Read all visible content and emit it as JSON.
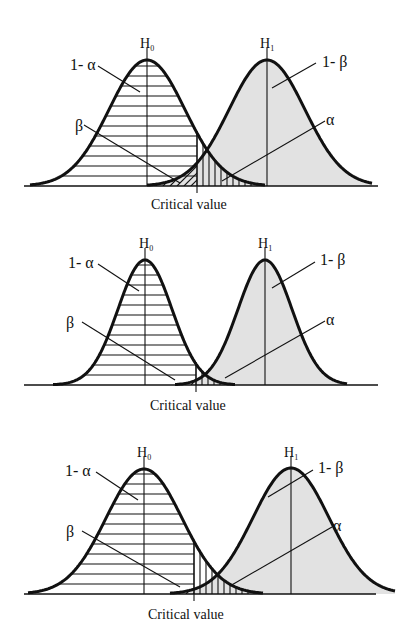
{
  "figure": {
    "colors": {
      "h1_fill": "#e2e2e2",
      "ink": "#111111",
      "background": "#ffffff"
    },
    "labels": {
      "h0": "H",
      "h0_sub": "0",
      "h1": "H",
      "h1_sub": "1",
      "one_minus_alpha": "1- α",
      "one_minus_beta": "1- β",
      "alpha": "α",
      "beta": "β",
      "critical_value": "Critical value"
    },
    "panels": [
      {
        "id": "panel-1",
        "baseline_y": 186,
        "axis_x": [
          24,
          378
        ],
        "h0": {
          "mean_x": 147,
          "peak_y": 60,
          "sigma": 38,
          "left_x": 30,
          "right_x": 265
        },
        "h1": {
          "mean_x": 267,
          "peak_y": 60,
          "sigma": 38,
          "left_x": 147,
          "right_x": 372
        },
        "critical_x": 197,
        "label_pos": {
          "h0": [
            140,
            48
          ],
          "h1": [
            260,
            48
          ],
          "one_minus_alpha": [
            70,
            70
          ],
          "one_minus_beta": [
            322,
            67
          ],
          "beta": [
            75,
            131
          ],
          "alpha": [
            326,
            125
          ],
          "critical_value": [
            151,
            209
          ]
        },
        "leaders": {
          "one_minus_alpha": [
            [
              98,
              66
            ],
            [
              140,
              92
            ]
          ],
          "one_minus_beta": [
            [
              316,
              63
            ],
            [
              272,
              88
            ]
          ],
          "beta": [
            [
              84,
              125
            ],
            [
              180,
              183
            ]
          ],
          "alpha": [
            [
              325,
              121
            ],
            [
              222,
              181
            ]
          ]
        }
      },
      {
        "id": "panel-2",
        "baseline_y": 385,
        "axis_x": [
          24,
          378
        ],
        "h0": {
          "mean_x": 145,
          "peak_y": 260,
          "sigma": 27,
          "left_x": 53,
          "right_x": 235
        },
        "h1": {
          "mean_x": 265,
          "peak_y": 260,
          "sigma": 27,
          "left_x": 175,
          "right_x": 347
        },
        "critical_x": 196,
        "label_pos": {
          "h0": [
            139,
            248
          ],
          "h1": [
            258,
            248
          ],
          "one_minus_alpha": [
            68,
            268
          ],
          "one_minus_beta": [
            320,
            265
          ],
          "beta": [
            66,
            328
          ],
          "alpha": [
            326,
            325
          ],
          "critical_value": [
            150,
            410
          ]
        },
        "leaders": {
          "one_minus_alpha": [
            [
              98,
              264
            ],
            [
              139,
              291
            ]
          ],
          "one_minus_beta": [
            [
              315,
              262
            ],
            [
              272,
              288
            ]
          ],
          "beta": [
            [
              82,
              322
            ],
            [
              175,
              380
            ]
          ],
          "alpha": [
            [
              325,
              321
            ],
            [
              225,
              378
            ]
          ]
        }
      },
      {
        "id": "panel-3",
        "baseline_y": 594,
        "axis_x": [
          24,
          376
        ],
        "h0": {
          "mean_x": 144,
          "peak_y": 469,
          "sigma": 38,
          "left_x": 28,
          "right_x": 263
        },
        "h1": {
          "mean_x": 291,
          "peak_y": 468,
          "sigma": 38,
          "left_x": 170,
          "right_x": 395
        },
        "critical_x": 194,
        "label_pos": {
          "h0": [
            137,
            457
          ],
          "h1": [
            284,
            457
          ],
          "one_minus_alpha": [
            65,
            476
          ],
          "one_minus_beta": [
            318,
            473
          ],
          "beta": [
            66,
            537
          ],
          "alpha": [
            333,
            531
          ],
          "critical_value": [
            148,
            619
          ]
        },
        "leaders": {
          "one_minus_alpha": [
            [
              96,
              472
            ],
            [
              138,
              500
            ]
          ],
          "one_minus_beta": [
            [
              313,
              470
            ],
            [
              268,
              497
            ]
          ],
          "beta": [
            [
              82,
              531
            ],
            [
              180,
              587
            ]
          ],
          "alpha": [
            [
              332,
              527
            ],
            [
              230,
              586
            ]
          ]
        }
      }
    ]
  }
}
